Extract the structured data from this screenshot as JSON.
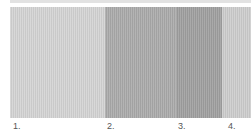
{
  "figure": {
    "bands": [
      {
        "label": "1.",
        "color": "#d4d4d4"
      },
      {
        "label": "2.",
        "color": "#ababab"
      },
      {
        "label": "3.",
        "color": "#a0a0a0"
      },
      {
        "label": "4.",
        "color": "#cdcdcd"
      }
    ]
  }
}
